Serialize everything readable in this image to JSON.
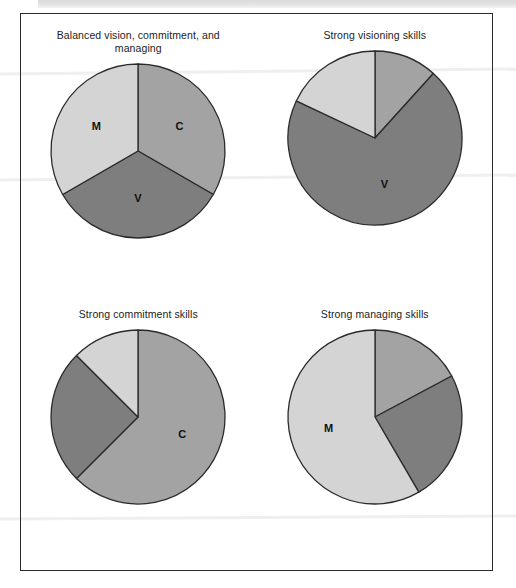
{
  "page": {
    "background": "#ffffff",
    "frame_border_color": "#2b2b2b"
  },
  "palette": {
    "commitment": "#a3a3a3",
    "visioning": "#7e7e7e",
    "managing": "#d4d4d4",
    "outline": "#2b2b2b",
    "label_text": "#101010",
    "title_text": "#1c1c1c"
  },
  "legend_keys": {
    "C": "Commitment",
    "V": "Visioning",
    "M": "Managing"
  },
  "chart_data": [
    {
      "type": "pie",
      "id": "balanced",
      "title": "Balanced vision, commitment, and managing",
      "start_angle": 0,
      "direction": "clockwise",
      "categories": [
        "C",
        "V",
        "M"
      ],
      "values": [
        33.3,
        33.3,
        33.3
      ],
      "labels": [
        "C",
        "V",
        "M"
      ],
      "colors": [
        "#a3a3a3",
        "#7e7e7e",
        "#d4d4d4"
      ],
      "radius": 87,
      "label_radius": 48,
      "show_labels": [
        true,
        true,
        true
      ]
    },
    {
      "type": "pie",
      "id": "strong-visioning",
      "title": "Strong visioning skills",
      "start_angle": 0,
      "direction": "clockwise",
      "categories": [
        "C",
        "V",
        "M"
      ],
      "values": [
        11.7,
        70.3,
        18.0
      ],
      "labels": [
        "C",
        "V",
        "M"
      ],
      "colors": [
        "#a3a3a3",
        "#7e7e7e",
        "#d4d4d4"
      ],
      "radius": 87,
      "label_radius": 48,
      "show_labels": [
        false,
        true,
        false
      ]
    },
    {
      "type": "pie",
      "id": "strong-commitment",
      "title": "Strong commitment skills",
      "start_angle": 0,
      "direction": "clockwise",
      "categories": [
        "C",
        "V",
        "M"
      ],
      "values": [
        62.5,
        25.0,
        12.5
      ],
      "labels": [
        "C",
        "V",
        "M"
      ],
      "colors": [
        "#a3a3a3",
        "#7e7e7e",
        "#d4d4d4"
      ],
      "radius": 87,
      "label_radius": 48,
      "show_labels": [
        true,
        false,
        false
      ]
    },
    {
      "type": "pie",
      "id": "strong-managing",
      "title": "Strong managing skills",
      "start_angle": 0,
      "direction": "clockwise",
      "categories": [
        "C",
        "V",
        "M"
      ],
      "values": [
        17.2,
        24.4,
        58.4
      ],
      "labels": [
        "C",
        "V",
        "M"
      ],
      "colors": [
        "#a3a3a3",
        "#7e7e7e",
        "#d4d4d4"
      ],
      "radius": 87,
      "label_radius": 48,
      "show_labels": [
        false,
        false,
        true
      ]
    }
  ]
}
